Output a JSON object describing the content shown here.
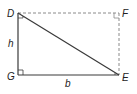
{
  "diagram": {
    "type": "geometry-right-triangle-in-rectangle",
    "colors": {
      "line": "#3a3a3a",
      "dashed": "#8a8a8a",
      "text": "#222222"
    },
    "vertices": {
      "D": {
        "label": "D",
        "x": 18,
        "y": 13
      },
      "F": {
        "label": "F",
        "x": 119,
        "y": 13
      },
      "G": {
        "label": "G",
        "x": 18,
        "y": 75
      },
      "E": {
        "label": "E",
        "x": 119,
        "y": 75
      }
    },
    "side_labels": {
      "height": "h",
      "base": "b"
    },
    "solid_segments": [
      "DG",
      "GE",
      "DE"
    ],
    "dashed_segments": [
      "DF",
      "FE"
    ],
    "right_angle_markers": [
      "G",
      "F",
      "D",
      "E"
    ]
  }
}
